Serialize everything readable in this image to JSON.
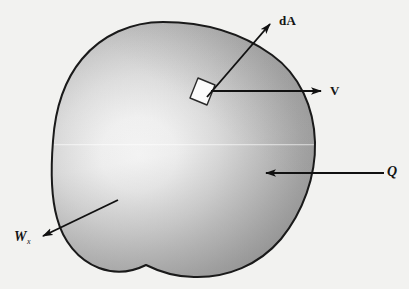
{
  "figure": {
    "background_color": "#f2f2f0",
    "outline_color": "#1a1a1a",
    "arrow_color": "#111111",
    "blob_light": "#fdfdfd",
    "blob_mid": "#bdbdbd",
    "blob_dark": "#8e8e8e",
    "patch_fill": "#fbfbfb"
  },
  "labels": {
    "area_vector": "dA",
    "velocity": "V",
    "heat": "Q",
    "work": "W",
    "work_subscript": "x"
  },
  "vectors": [
    {
      "name": "area-normal-vector",
      "label": "dA",
      "from_x": 207,
      "from_y": 97,
      "to_x": 272,
      "to_y": 22,
      "direction": "up-right"
    },
    {
      "name": "velocity-vector",
      "label": "V",
      "from_x": 211,
      "from_y": 91,
      "to_x": 323,
      "to_y": 91,
      "direction": "right"
    },
    {
      "name": "heat-vector",
      "label": "Q",
      "from_x": 384,
      "from_y": 173,
      "to_x": 264,
      "to_y": 173,
      "direction": "left"
    },
    {
      "name": "work-vector",
      "label": "W",
      "from_x": 118,
      "from_y": 200,
      "to_x": 41,
      "to_y": 237,
      "direction": "down-left"
    }
  ],
  "surface_element": {
    "name": "differential-area-patch",
    "center_x": 202,
    "center_y": 92,
    "width": 20,
    "height": 17
  }
}
